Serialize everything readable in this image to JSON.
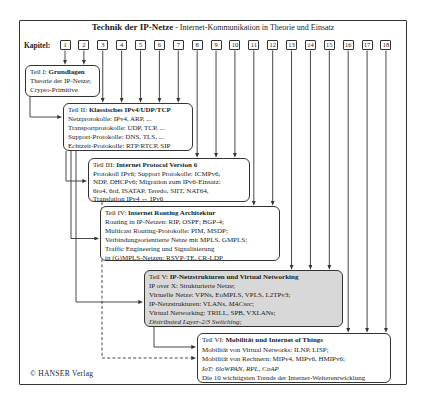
{
  "figure": {
    "title_main": "Technik der IP-Netze",
    "title_subtitle": " - Internet-Kommunikation in Theorie und Einsatz",
    "kapitel_label": "Kapitel:",
    "copyright": "© HANSER Verlag"
  },
  "chapters": [
    "1",
    "2",
    "3",
    "4",
    "5",
    "6",
    "7",
    "8",
    "9",
    "10",
    "11",
    "12",
    "13",
    "14",
    "15",
    "16",
    "17",
    "18"
  ],
  "parts": [
    {
      "title_prefix": "Teil I: ",
      "title": "Grundlagen",
      "shaded": false,
      "chapters": [
        1,
        2
      ],
      "lines": [
        [
          {
            "t": "Theorie der IP-Netze;"
          }
        ],
        [
          {
            "t": "Crypto-Primitive"
          }
        ]
      ]
    },
    {
      "title_prefix": "Teil II: ",
      "title": "Klassisches IPv4/UDP/TCP",
      "shaded": false,
      "chapters": [
        3,
        4,
        5,
        6,
        7
      ],
      "lines": [
        [
          {
            "t": "Netzprotokolle: IPv4, ARP, ..."
          }
        ],
        [
          {
            "t": "Transportprotokolle: UDP, TCP, ..."
          }
        ],
        [
          {
            "t": "Support-Protokolle: DNS, TLS, ..."
          }
        ],
        [
          {
            "t": "Echtzeit-Protokolle: RTP/RTCP, SIP"
          }
        ]
      ]
    },
    {
      "title_prefix": "Teil III: ",
      "title": "Internet Protocol Version 6",
      "shaded": false,
      "chapters": [
        8,
        9,
        10
      ],
      "lines": [
        [
          {
            "t": "Protokoll IPv6; Support Protokolle: ICMPv6,"
          }
        ],
        [
          {
            "t": "NDP, DHCPv6; Migration zum IPv6-Einsatz:"
          }
        ],
        [
          {
            "t": "6to4, 6rd, ISATAP, Teredo, SIIT, NAT64,"
          }
        ],
        [
          {
            "t": "Translation IPv4 ↔ IPv6"
          }
        ]
      ]
    },
    {
      "title_prefix": "Teil IV: ",
      "title": "Internet Routing Architektur",
      "shaded": false,
      "chapters": [
        11,
        12
      ],
      "lines": [
        [
          {
            "t": "Routing in IP-Netzen: RIP, OSPF; BGP-4;"
          }
        ],
        [
          {
            "t": "Multicast Routing-Protokolle: PIM, MSDP;"
          }
        ],
        [
          {
            "t": "Verbindungsorientierte Netze mit MPLS, GMPLS;"
          }
        ],
        [
          {
            "t": "Traffic Engineering und Signalisierung"
          }
        ],
        [
          {
            "t": "in (G)MPLS-Netzen: RSVP-TE, CR-LDP"
          }
        ]
      ]
    },
    {
      "title_prefix": "Teil V: ",
      "title": "IP-Netzstrukturen und Virtual Networking",
      "shaded": true,
      "chapters": [
        13,
        14,
        15
      ],
      "lines": [
        [
          {
            "t": "IP over X: Strukturierte Netze;"
          }
        ],
        [
          {
            "t": "Virtuelle Netze: VPNs, EoMPLS, VPLS, L2TPv3;"
          }
        ],
        [
          {
            "t": "IP-Netzstrukturen: VLANs, "
          },
          {
            "t": "MACsec",
            "i": true
          },
          {
            "t": ";"
          }
        ],
        [
          {
            "t": "Virtual Networking: TRILL, SPB, VXLANs;"
          }
        ],
        [
          {
            "t": "Distributed Layer-2/3 Switching;",
            "i": true
          }
        ]
      ]
    },
    {
      "title_prefix": "Teil VI: ",
      "title": "Mobilität und Internet of Things",
      "shaded": false,
      "chapters": [
        16,
        17,
        18
      ],
      "lines": [
        [
          {
            "t": "Mobilität von Virtual Networks: ILNP, LISP;"
          }
        ],
        [
          {
            "t": "Mobilität von Rechnern: MIPv4, MIPv6, HMIPv6;"
          }
        ],
        [
          {
            "t": "IoT: 6loWPAN, RPL, CoAP",
            "i": true
          }
        ],
        [
          {
            "t": "Die 10 wichtigsten Trends der Internet-Weiterentwicklung"
          }
        ]
      ]
    }
  ],
  "dependencies": [
    {
      "from": "Teil I",
      "to": "Teil II",
      "style": "solid"
    },
    {
      "from": "Teil II",
      "to": "Teil III",
      "style": "solid"
    },
    {
      "from": "Teil II",
      "to": "Teil IV",
      "style": "solid"
    },
    {
      "from": "Teil II",
      "to": "Teil V",
      "style": "solid"
    },
    {
      "from": "Teil III",
      "to": "Teil VI",
      "style": "dashed"
    },
    {
      "from": "Teil V",
      "to": "Teil VI",
      "style": "solid"
    }
  ],
  "colors": {
    "line": "#333333",
    "text": "#1c1c1c",
    "shaded_box_background": "#d8d8d8",
    "box_background": "#ffffff"
  }
}
